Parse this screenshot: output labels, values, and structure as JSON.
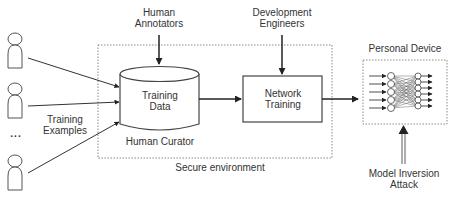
{
  "diagram": {
    "labels": {
      "human_annotators_line1": "Human",
      "human_annotators_line2": "Annotators",
      "development_engineers_line1": "Development",
      "development_engineers_line2": "Engineers",
      "training_data_line1": "Training",
      "training_data_line2": "Data",
      "human_curator": "Human Curator",
      "network_training_line1": "Network",
      "network_training_line2": "Training",
      "secure_environment": "Secure environment",
      "personal_device": "Personal Device",
      "training_examples_line1": "Training",
      "training_examples_line2": "Examples",
      "ellipsis": "...",
      "model_inversion_line1": "Model Inversion",
      "model_inversion_line2": "Attack"
    },
    "nodes": [
      {
        "id": "person-1",
        "type": "person-icon"
      },
      {
        "id": "person-2",
        "type": "person-icon"
      },
      {
        "id": "person-n",
        "type": "person-icon"
      },
      {
        "id": "training-data",
        "type": "database-cylinder"
      },
      {
        "id": "network-training",
        "type": "process-box"
      },
      {
        "id": "neural-network",
        "type": "neural-network-icon"
      }
    ],
    "edges": [
      {
        "from": "person-1",
        "to": "training-data"
      },
      {
        "from": "person-2",
        "to": "training-data"
      },
      {
        "from": "person-n",
        "to": "training-data"
      },
      {
        "from": "human-annotators",
        "to": "training-data"
      },
      {
        "from": "training-data",
        "to": "network-training"
      },
      {
        "from": "development-engineers",
        "to": "network-training"
      },
      {
        "from": "network-training",
        "to": "personal-device"
      },
      {
        "from": "model-inversion-attack",
        "to": "personal-device"
      }
    ],
    "colors": {
      "stroke": "#333333",
      "dotted": "#777777",
      "background": "#ffffff"
    }
  }
}
